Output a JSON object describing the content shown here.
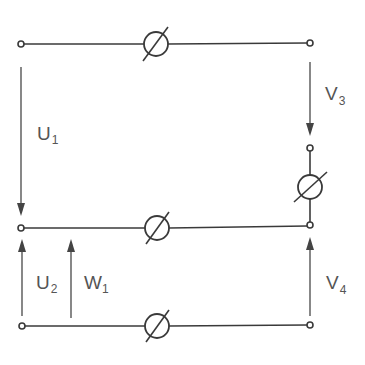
{
  "diagram": {
    "type": "circuit-two-port-measurement",
    "colors": {
      "line": "#3a3a3a",
      "arrow": "#444444",
      "text": "#555555",
      "background": "#ffffff"
    },
    "labels": {
      "U1": {
        "main": "U",
        "sub": "1"
      },
      "U2": {
        "main": "U",
        "sub": "2"
      },
      "W1": {
        "main": "W",
        "sub": "1"
      },
      "V3": {
        "main": "V",
        "sub": "3"
      },
      "V4": {
        "main": "V",
        "sub": "4"
      }
    },
    "terminals": [
      {
        "id": "top-left",
        "x": 21,
        "y": 44
      },
      {
        "id": "top-right",
        "x": 310,
        "y": 43
      },
      {
        "id": "right-mid-upper",
        "x": 310,
        "y": 148
      },
      {
        "id": "middle-left",
        "x": 21,
        "y": 228
      },
      {
        "id": "middle-right",
        "x": 310,
        "y": 225
      },
      {
        "id": "bottom-left",
        "x": 22,
        "y": 326
      },
      {
        "id": "bottom-right",
        "x": 310,
        "y": 325
      }
    ],
    "meters": [
      {
        "id": "top-meter",
        "cx": 156,
        "cy": 44
      },
      {
        "id": "right-meter",
        "cx": 310,
        "cy": 187
      },
      {
        "id": "middle-meter",
        "cx": 157,
        "cy": 228
      },
      {
        "id": "bottom-meter",
        "cx": 157,
        "cy": 326
      }
    ],
    "arrows": [
      {
        "id": "U1",
        "direction": "down",
        "x": 21,
        "from": 67,
        "to": 215
      },
      {
        "id": "U2",
        "direction": "up",
        "x": 21,
        "from": 316,
        "to": 239
      },
      {
        "id": "W1",
        "direction": "up",
        "x": 71,
        "from": 318,
        "to": 239
      },
      {
        "id": "V3",
        "direction": "down",
        "x": 310,
        "from": 62,
        "to": 136
      },
      {
        "id": "V4",
        "direction": "up",
        "x": 310,
        "from": 316,
        "to": 237
      }
    ]
  }
}
